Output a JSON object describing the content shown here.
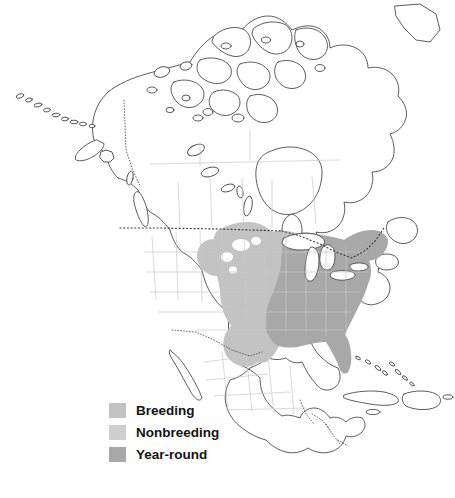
{
  "figure": {
    "type": "species-range-map",
    "region": "North America",
    "background_color": "#ffffff",
    "width": 455,
    "height": 498
  },
  "map_style": {
    "coastline_color": "#4a4a4a",
    "subdivision_color": "#c9c9c9",
    "national_border_style": "dotted",
    "national_border_color": "#3b3b3b",
    "water_fill": "#ffffff",
    "land_fill": "#ffffff"
  },
  "legend": {
    "items": [
      {
        "label": "Breeding",
        "color": "#c3c3c3"
      },
      {
        "label": "Nonbreeding",
        "color": "#cfcfcf"
      },
      {
        "label": "Year-round",
        "color": "#a8a8a8"
      }
    ]
  },
  "range_overlays": [
    {
      "category": "Breeding",
      "color": "#c3c3c3",
      "description": "Northern Great Plains, upper Midwest and southern prairie Canada, plus western Gulf coastal plain into eastern Texas"
    },
    {
      "category": "Year-round",
      "color": "#a8a8a8",
      "description": "Eastern United States from the Great Lakes and New England south through the Appalachians, Southeast and Florida"
    }
  ]
}
